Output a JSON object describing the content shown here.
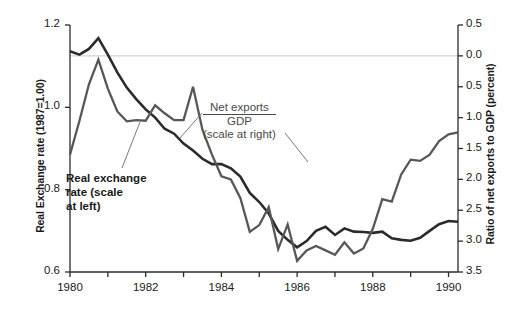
{
  "chart_data": {
    "type": "line",
    "title": "",
    "xlabel": "",
    "ylabel": "Real Exchange rate (1987=1.00)",
    "ylabel_right": "Ratio of net exports to GDP (percent)",
    "xlim": [
      1980,
      1990.25
    ],
    "ylim": [
      0.6,
      1.2
    ],
    "ylim_right": [
      -3.5,
      0.5
    ],
    "xticks": [
      1980,
      1981,
      1982,
      1983,
      1984,
      1985,
      1986,
      1987,
      1988,
      1989,
      1990
    ],
    "xtick_labels": [
      "1980",
      "",
      "1982",
      "",
      "1984",
      "",
      "1986",
      "",
      "1988",
      "",
      "1990"
    ],
    "yticks_left": [
      0.6,
      0.8,
      1.0,
      1.2
    ],
    "ytick_labels_left": [
      "0.6",
      "0.8",
      "1.0",
      "1.2"
    ],
    "yticks_right": [
      0.5,
      0.0,
      -0.5,
      -1.0,
      -1.5,
      -2.0,
      -2.5,
      -3.0,
      -3.5
    ],
    "ytick_labels_right": [
      "0.5",
      "0.0",
      "0.5",
      "1.0",
      "1.5",
      "2.0",
      "2.5",
      "3.0",
      "3.5"
    ],
    "grid": false,
    "reference_line_right": 0.0,
    "legend_position": "inline-annotation",
    "series": [
      {
        "name": "Real exchange rate (scale at left)",
        "axis": "left",
        "color": "#2b2b2b",
        "width": 2.6,
        "x": [
          1980.0,
          1980.25,
          1980.5,
          1980.75,
          1981.0,
          1981.25,
          1981.5,
          1981.75,
          1982.0,
          1982.25,
          1982.5,
          1982.75,
          1983.0,
          1983.25,
          1983.5,
          1983.75,
          1984.0,
          1984.25,
          1984.5,
          1984.75,
          1985.0,
          1985.25,
          1985.5,
          1985.75,
          1986.0,
          1986.25,
          1986.5,
          1986.75,
          1987.0,
          1987.25,
          1987.5,
          1987.75,
          1988.0,
          1988.25,
          1988.5,
          1988.75,
          1989.0,
          1989.25,
          1989.5,
          1989.75,
          1990.0,
          1990.25
        ],
        "y": [
          1.136,
          1.128,
          1.142,
          1.168,
          1.128,
          1.085,
          1.048,
          1.02,
          0.995,
          0.975,
          0.948,
          0.936,
          0.912,
          0.895,
          0.875,
          0.862,
          0.862,
          0.852,
          0.832,
          0.792,
          0.77,
          0.742,
          0.7,
          0.678,
          0.66,
          0.675,
          0.7,
          0.71,
          0.69,
          0.706,
          0.698,
          0.697,
          0.695,
          0.698,
          0.682,
          0.678,
          0.676,
          0.683,
          0.7,
          0.716,
          0.724,
          0.722
        ]
      },
      {
        "name": "Net exports / GDP (scale at right)",
        "axis": "right",
        "color": "#575757",
        "width": 2.3,
        "x": [
          1980.0,
          1980.25,
          1980.5,
          1980.75,
          1981.0,
          1981.25,
          1981.5,
          1981.75,
          1982.0,
          1982.25,
          1982.5,
          1982.75,
          1983.0,
          1983.25,
          1983.5,
          1983.75,
          1984.0,
          1984.25,
          1984.5,
          1984.75,
          1985.0,
          1985.25,
          1985.5,
          1985.75,
          1986.0,
          1986.25,
          1986.5,
          1986.75,
          1987.0,
          1987.25,
          1987.5,
          1987.75,
          1988.0,
          1988.25,
          1988.5,
          1988.75,
          1989.0,
          1989.25,
          1989.5,
          1989.75,
          1990.0,
          1990.25
        ],
        "y": [
          -1.6,
          -1.05,
          -0.46,
          -0.06,
          -0.53,
          -0.9,
          -1.06,
          -1.04,
          -1.05,
          -0.8,
          -0.93,
          -1.04,
          -1.04,
          -0.5,
          -1.2,
          -1.6,
          -1.95,
          -2.0,
          -2.3,
          -2.85,
          -2.74,
          -2.45,
          -3.13,
          -2.73,
          -3.32,
          -3.15,
          -3.08,
          -3.15,
          -3.22,
          -3.02,
          -3.2,
          -3.12,
          -2.8,
          -2.32,
          -2.36,
          -1.92,
          -1.68,
          -1.7,
          -1.6,
          -1.38,
          -1.27,
          -1.24
        ]
      }
    ],
    "annotations": [
      {
        "name": "net-exports-label",
        "numerator": "Net exports",
        "denominator": "GDP",
        "note": "(scale at right)"
      },
      {
        "name": "real-exchange-label",
        "lines": [
          "Real exchange",
          "rate (scale",
          "at left)"
        ]
      }
    ]
  },
  "axes": {
    "left_title": "Real Exchange rate (1987=1.00)",
    "right_title": "Ratio of net exports to GDP (percent)"
  },
  "colors": {
    "real_exchange_line": "#2b2b2b",
    "net_exports_line": "#575757",
    "axis": "#2b2b2b",
    "reference_line": "#c8c8c8",
    "background": "#ffffff"
  }
}
